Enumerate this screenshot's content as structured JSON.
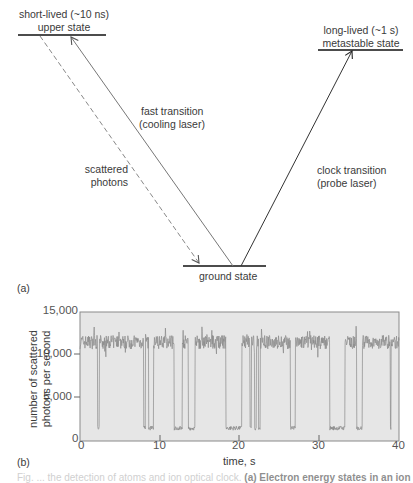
{
  "panel_a": {
    "label": "(a)",
    "states": {
      "upper": {
        "line1": "short-lived (~10 ns)",
        "line2": "upper state"
      },
      "metastable": {
        "line1": "long-lived (~1 s)",
        "line2": "metastable state"
      },
      "ground": {
        "label": "ground state"
      }
    },
    "transitions": {
      "cooling": {
        "line1": "fast transition",
        "line2": "(cooling laser)"
      },
      "scattered": {
        "line1": "scattered",
        "line2": "photons"
      },
      "clock": {
        "line1": "clock transition",
        "line2": "(probe laser)"
      }
    },
    "colors": {
      "solid_line": "#777777",
      "dashed_line": "#888888",
      "level_line": "#111111",
      "clock_line": "#333333"
    }
  },
  "panel_b": {
    "label": "(b)",
    "ylabel_line1": "number of scattered",
    "ylabel_line2": "photons per second",
    "xlabel": "time, s",
    "yticks": [
      "15,000",
      "10,000",
      "5,000",
      "0"
    ],
    "xticks": [
      "0",
      "10",
      "20",
      "30",
      "40"
    ],
    "colors": {
      "plot_bg": "#e6e6e6",
      "trace": "#8a8a8a",
      "frame": "#888888"
    }
  },
  "caption": {
    "faint": "Fig. ... the detection of atoms and ion optical clock.",
    "bold": "(a) Electron energy states in an ion"
  },
  "chart_data": {
    "type": "line",
    "title": "",
    "xlabel": "time, s",
    "ylabel": "number of scattered photons per second",
    "xlim": [
      0,
      40
    ],
    "ylim": [
      0,
      15000
    ],
    "xticks": [
      0,
      10,
      20,
      30,
      40
    ],
    "yticks": [
      0,
      5000,
      10000,
      15000
    ],
    "grid": false,
    "legend": null,
    "series": [
      {
        "name": "scattered photon rate (quantum jumps)",
        "baseline_high": 11500,
        "baseline_noise": 800,
        "low_level": 1500,
        "dark_intervals_s": [
          [
            2.2,
            2.4
          ],
          [
            8.0,
            8.2
          ],
          [
            8.6,
            9.2
          ],
          [
            11.8,
            12.8
          ],
          [
            13.6,
            14.4
          ],
          [
            18.3,
            20.3
          ],
          [
            21.3,
            21.5
          ],
          [
            21.9,
            22.1
          ],
          [
            22.4,
            22.6
          ],
          [
            26.4,
            27.0
          ],
          [
            31.3,
            33.2
          ],
          [
            34.7,
            35.4
          ],
          [
            38.9,
            39.0
          ]
        ]
      }
    ]
  }
}
